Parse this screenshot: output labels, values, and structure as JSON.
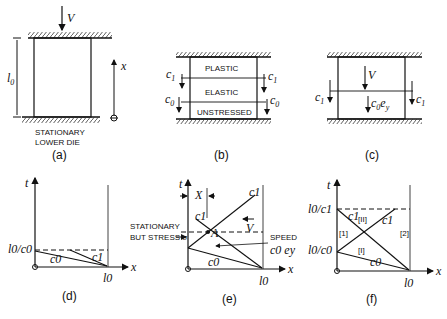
{
  "panels": {
    "a": {
      "caption": "(a)",
      "velocity_label": "V",
      "length_label": "l",
      "length_sub": "0",
      "axis_label": "x",
      "die_label_line1": "STATIONARY",
      "die_label_line2": "LOWER DIE"
    },
    "b": {
      "caption": "(b)",
      "regions": [
        "PLASTIC",
        "ELASTIC",
        "UNSTRESSED"
      ],
      "wave_c1": "c",
      "wave_c1_sub": "1",
      "wave_c0": "c",
      "wave_c0_sub": "0"
    },
    "c": {
      "caption": "(c)",
      "velocity_label": "V",
      "wave_c1": "c",
      "wave_c1_sub": "1",
      "particle_speed": "c",
      "particle_speed_sub": "0",
      "particle_speed_e": "e",
      "particle_speed_e_sub": "y"
    },
    "d": {
      "caption": "(d)",
      "t_axis": "t",
      "x_axis": "x",
      "t_tick": "l0/c0",
      "x_tick": "l0",
      "line_c0": "c0",
      "line_c1": "c1"
    },
    "e": {
      "caption": "(e)",
      "t_axis": "t",
      "x_axis": "x",
      "X_label": "X",
      "point_A": "A",
      "V_label": "V",
      "stationary_line1": "STATIONARY",
      "stationary_line2": "BUT STRESS σ",
      "speed_label": "SPEED",
      "speed_value": "c0 ey",
      "x_tick": "l0",
      "line_c0": "c0",
      "line_c1_a": "c1",
      "line_c1_b": "c1"
    },
    "f": {
      "caption": "(f)",
      "t_axis": "t",
      "x_axis": "x",
      "t_tick_upper": "l0/c1",
      "t_tick_lower": "l0/c0",
      "x_tick": "l0",
      "regions": [
        "[1]",
        "[II]",
        "[2]",
        "[I]"
      ],
      "line_c0": "c0",
      "line_c1_a": "c1",
      "line_c1_b": "c1"
    }
  }
}
